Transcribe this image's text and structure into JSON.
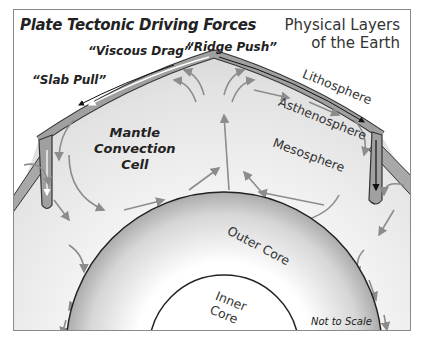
{
  "diagram": {
    "title": "Plate Tectonic Driving Forces",
    "subtitle_line1": "Physical Layers",
    "subtitle_line2": "of the Earth",
    "forces": {
      "viscous_drag": "“Viscous Drag”",
      "ridge_push": "“Ridge Push”",
      "slab_pull": "“Slab Pull”"
    },
    "layers": {
      "lithosphere": "Lithosphere",
      "asthenosphere": "Asthenosphere",
      "mesosphere": "Mesosphere",
      "outer_core": "Outer Core",
      "inner_core_line1": "Inner",
      "inner_core_line2": "Core"
    },
    "mantle_cell_line1": "Mantle",
    "mantle_cell_line2": "Convection",
    "mantle_cell_line3": "Cell",
    "scale_note": "Not to Scale",
    "colors": {
      "mantle": "#dcdcdc",
      "plate": "#9a9a9a",
      "arrow": "#8c8c8c",
      "outline": "#2a2a2a"
    }
  }
}
